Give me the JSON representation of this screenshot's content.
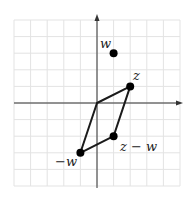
{
  "diagram": {
    "title": "",
    "grid": {
      "xmin": -5,
      "xmax": 5,
      "ymin": -5,
      "ymax": 5,
      "step": 1
    },
    "axes": {
      "x_arrow": true,
      "y_arrow": true
    },
    "points": [
      {
        "id": "w",
        "label": "w",
        "x": 1,
        "y": 3
      },
      {
        "id": "z",
        "label": "z",
        "x": 2,
        "y": 1
      },
      {
        "id": "z_minus_w",
        "label": "z − w",
        "x": 1,
        "y": -2
      },
      {
        "id": "neg_w",
        "label": "−w",
        "x": -1,
        "y": -3
      }
    ],
    "parallelogram": [
      "origin",
      "z",
      "z_minus_w",
      "neg_w"
    ],
    "colors": {
      "grid": "#e3e3e3",
      "axis": "#333333",
      "shape": "#1a1a1a",
      "point": "#000000"
    }
  }
}
